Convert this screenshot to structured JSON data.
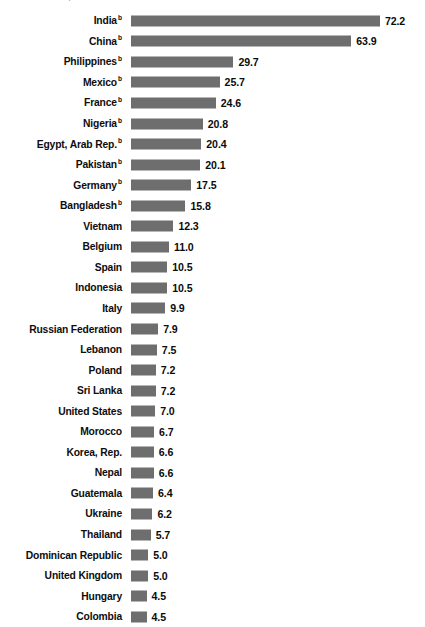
{
  "caption": "US$ billions",
  "chart_data": {
    "type": "bar",
    "orientation": "horizontal",
    "title": "US$ billions",
    "xlabel": "",
    "ylabel": "",
    "xlim": [
      0,
      72.2
    ],
    "grid": false,
    "legend": null,
    "value_format": "one-decimal",
    "footnote_marker": "b",
    "categories": [
      "India",
      "China",
      "Philippines",
      "Mexico",
      "France",
      "Nigeria",
      "Egypt, Arab Rep.",
      "Pakistan",
      "Germany",
      "Bangladesh",
      "Vietnam",
      "Belgium",
      "Spain",
      "Indonesia",
      "Italy",
      "Russian Federation",
      "Lebanon",
      "Poland",
      "Sri Lanka",
      "United States",
      "Morocco",
      "Korea, Rep.",
      "Nepal",
      "Guatemala",
      "Ukraine",
      "Thailand",
      "Dominican Republic",
      "United Kingdom",
      "Hungary",
      "Colombia"
    ],
    "values": [
      72.2,
      63.9,
      29.7,
      25.7,
      24.6,
      20.8,
      20.4,
      20.1,
      17.5,
      15.8,
      12.3,
      11.0,
      10.5,
      10.5,
      9.9,
      7.9,
      7.5,
      7.2,
      7.2,
      7.0,
      6.7,
      6.6,
      6.6,
      6.4,
      6.2,
      5.7,
      5.0,
      5.0,
      4.5,
      4.5
    ],
    "value_labels": [
      "72.2",
      "63.9",
      "29.7",
      "25.7",
      "24.6",
      "20.8",
      "20.4",
      "20.1",
      "17.5",
      "15.8",
      "12.3",
      "11.0",
      "10.5",
      "10.5",
      "9.9",
      "7.9",
      "7.5",
      "7.2",
      "7.2",
      "7.0",
      "6.7",
      "6.6",
      "6.6",
      "6.4",
      "6.2",
      "5.7",
      "5.0",
      "5.0",
      "4.5",
      "4.5"
    ],
    "marked_categories": [
      "India",
      "China",
      "Philippines",
      "Mexico",
      "France",
      "Nigeria",
      "Egypt, Arab Rep.",
      "Pakistan",
      "Germany",
      "Bangladesh"
    ],
    "colors": {
      "bar": "#6e6e6e",
      "text": "#0d0d0d",
      "background": "#ffffff"
    }
  },
  "layout": {
    "bar_origin_x": 131,
    "px_per_unit": 3.448,
    "row_pitch": 20.55,
    "first_row_top": 10.5,
    "bar_height": 11,
    "value_gap": 5
  }
}
